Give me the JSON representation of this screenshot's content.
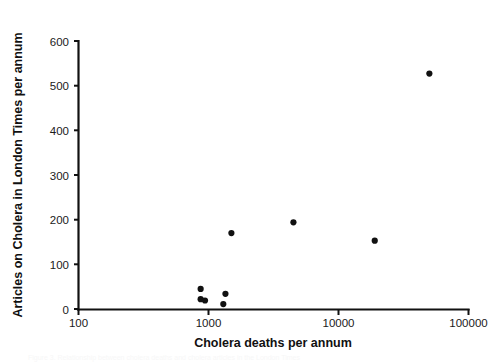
{
  "figure": {
    "background": "#ffffff",
    "marker_color": "#111111",
    "axis_color": "#111111"
  },
  "caption_partial": "Figure 3. Relationship between cholera deaths and cholera articles in the London Times",
  "chart_data": {
    "type": "scatter",
    "title": "",
    "xlabel": "Cholera deaths per annum",
    "ylabel": "Articles on Cholera in London Times per annum",
    "xscale": "log",
    "yscale": "linear",
    "xlim": [
      100,
      100000
    ],
    "ylim": [
      0,
      600
    ],
    "grid": false,
    "legend": null,
    "xticks": [
      100,
      1000,
      10000,
      100000
    ],
    "xtick_labels": [
      "100",
      "1000",
      "10000",
      "100000"
    ],
    "yticks": [
      0,
      100,
      200,
      300,
      400,
      500,
      600
    ],
    "ytick_labels": [
      "0",
      "100",
      "200",
      "300",
      "400",
      "500",
      "600"
    ],
    "marker": "circle",
    "marker_size": 5,
    "points": [
      {
        "x": 870,
        "y": 45
      },
      {
        "x": 870,
        "y": 22
      },
      {
        "x": 940,
        "y": 19
      },
      {
        "x": 1350,
        "y": 34
      },
      {
        "x": 1300,
        "y": 11
      },
      {
        "x": 1500,
        "y": 170
      },
      {
        "x": 4500,
        "y": 194
      },
      {
        "x": 19000,
        "y": 153
      },
      {
        "x": 50000,
        "y": 527
      }
    ]
  }
}
